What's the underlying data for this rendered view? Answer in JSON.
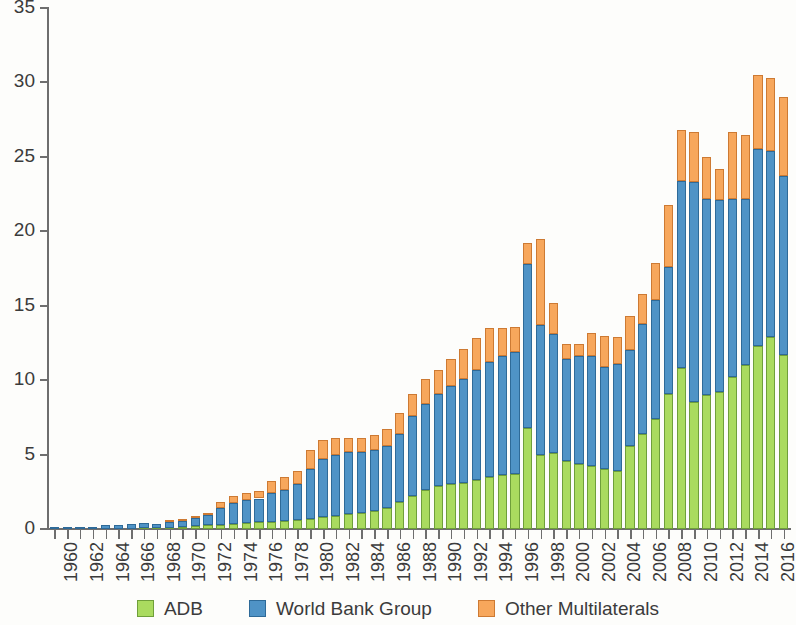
{
  "chart_data": {
    "type": "bar",
    "stacked": true,
    "title": "",
    "subtitle": "",
    "xlabel": "",
    "ylabel": "",
    "ylim": [
      0,
      35
    ],
    "ytick_step": 5,
    "yticks": [
      0,
      5,
      10,
      15,
      20,
      25,
      30,
      35
    ],
    "grid": false,
    "legend_position": "bottom",
    "xtick_label_rotation": -90,
    "xtick_label_interval": 2,
    "categories": [
      "1960",
      "1961",
      "1962",
      "1963",
      "1964",
      "1965",
      "1966",
      "1967",
      "1968",
      "1969",
      "1970",
      "1971",
      "1972",
      "1973",
      "1974",
      "1975",
      "1976",
      "1977",
      "1978",
      "1979",
      "1980",
      "1981",
      "1982",
      "1983",
      "1984",
      "1985",
      "1986",
      "1987",
      "1988",
      "1989",
      "1990",
      "1991",
      "1992",
      "1993",
      "1994",
      "1995",
      "1996",
      "1997",
      "1998",
      "1999",
      "2000",
      "2001",
      "2002",
      "2003",
      "2004",
      "2005",
      "2006",
      "2007",
      "2008",
      "2009",
      "2010",
      "2011",
      "2012",
      "2013",
      "2014",
      "2015",
      "2016",
      "2017"
    ],
    "xtick_labels": [
      "1960",
      "1962",
      "1964",
      "1966",
      "1968",
      "1970",
      "1972",
      "1974",
      "1976",
      "1978",
      "1980",
      "1982",
      "1984",
      "1986",
      "1988",
      "1990",
      "1992",
      "1994",
      "1996",
      "1998",
      "2000",
      "2002",
      "2004",
      "2006",
      "2008",
      "2010",
      "2012",
      "2014",
      "2016"
    ],
    "series": [
      {
        "name": "ADB",
        "color": "#aadb5f",
        "values": [
          0.0,
          0.0,
          0.0,
          0.0,
          0.0,
          0.0,
          0.0,
          0.05,
          0.08,
          0.1,
          0.12,
          0.18,
          0.25,
          0.3,
          0.35,
          0.4,
          0.45,
          0.5,
          0.55,
          0.6,
          0.7,
          0.8,
          0.9,
          1.0,
          1.1,
          1.2,
          1.4,
          1.8,
          2.2,
          2.6,
          2.9,
          3.0,
          3.1,
          3.3,
          3.5,
          3.6,
          3.7,
          6.8,
          5.0,
          5.1,
          4.6,
          4.4,
          4.2,
          4.0,
          3.9,
          5.6,
          6.4,
          7.4,
          9.1,
          10.8,
          8.5,
          9.0,
          9.2,
          10.2,
          11.0,
          12.3,
          12.9,
          11.7
        ]
      },
      {
        "name": "World Bank Group",
        "color": "#4f93c6",
        "values": [
          0.1,
          0.12,
          0.14,
          0.16,
          0.25,
          0.3,
          0.33,
          0.35,
          0.27,
          0.4,
          0.43,
          0.58,
          0.7,
          1.1,
          1.4,
          1.55,
          1.6,
          1.9,
          2.1,
          2.4,
          3.3,
          3.9,
          4.1,
          4.2,
          4.1,
          4.1,
          4.2,
          4.6,
          5.4,
          5.8,
          6.2,
          6.6,
          7.0,
          7.4,
          7.7,
          8.0,
          8.2,
          11.0,
          8.7,
          8.0,
          6.8,
          7.2,
          7.4,
          6.9,
          7.2,
          6.4,
          7.4,
          8.0,
          8.5,
          12.6,
          14.8,
          13.2,
          12.9,
          12.0,
          11.2,
          13.2,
          12.5,
          12.0
        ]
      },
      {
        "name": "Other Multilaterals",
        "color": "#f7a75c",
        "values": [
          0.0,
          0.0,
          0.0,
          0.0,
          0.0,
          0.0,
          0.0,
          0.0,
          0.0,
          0.05,
          0.05,
          0.1,
          0.15,
          0.4,
          0.45,
          0.45,
          0.5,
          0.8,
          0.85,
          0.9,
          1.3,
          1.3,
          1.1,
          0.9,
          0.9,
          1.0,
          1.1,
          1.4,
          1.5,
          1.7,
          1.6,
          1.8,
          2.0,
          2.1,
          2.3,
          1.9,
          1.7,
          1.4,
          5.8,
          2.1,
          1.0,
          0.8,
          1.6,
          2.1,
          1.8,
          2.3,
          2.0,
          2.5,
          4.2,
          3.4,
          3.4,
          2.8,
          2.1,
          4.5,
          4.3,
          5.0,
          4.9,
          5.3
        ]
      }
    ]
  },
  "legend": {
    "items": [
      {
        "key": "adb",
        "label": "ADB"
      },
      {
        "key": "wbg",
        "label": "World Bank Group"
      },
      {
        "key": "other",
        "label": "Other Multilaterals"
      }
    ]
  }
}
